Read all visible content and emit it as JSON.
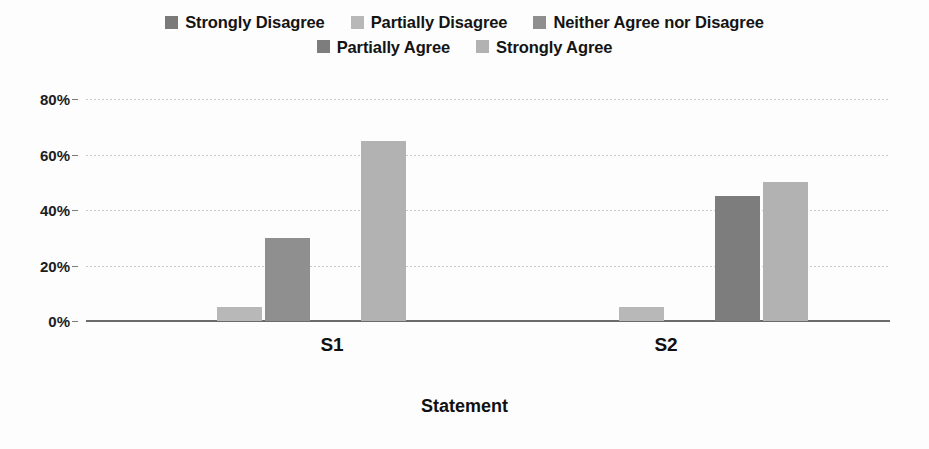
{
  "chart_data": {
    "type": "bar",
    "title": "",
    "subtitle": "",
    "xlabel": "Statement",
    "ylabel": "",
    "categories": [
      "S1",
      "S2"
    ],
    "ylim": [
      0,
      80
    ],
    "ytick_values": [
      0,
      20,
      40,
      60,
      80
    ],
    "ytick_labels": [
      "0%",
      "20%",
      "40%",
      "60%",
      "80%"
    ],
    "grid": true,
    "legend_position": "top",
    "orientation": "vertical",
    "grouping": "clustered",
    "series": [
      {
        "name": "Strongly Disagree",
        "color": "#7a7a7a",
        "values": [
          0,
          0
        ]
      },
      {
        "name": "Partially Disagree",
        "color": "#b8b8b8",
        "values": [
          5,
          5
        ]
      },
      {
        "name": "Neither Agree nor Disagree",
        "color": "#8f8f8f",
        "values": [
          30,
          0
        ]
      },
      {
        "name": "Partially Agree",
        "color": "#7d7d7d",
        "values": [
          0,
          45
        ]
      },
      {
        "name": "Strongly Agree",
        "color": "#b2b2b2",
        "values": [
          65,
          50
        ]
      }
    ]
  },
  "legend": {
    "rows": [
      [
        "Strongly Disagree",
        "Partially Disagree",
        "Neither Agree nor Disagree"
      ],
      [
        "Partially Agree",
        "Strongly Agree"
      ]
    ]
  }
}
